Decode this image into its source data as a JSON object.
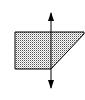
{
  "diagram": {
    "shape": {
      "type": "polygon",
      "fill_pattern": "stipple-dots",
      "stroke_color": "#000000",
      "fill_color": "#9a9a9a",
      "vertices": [
        [
          15,
          32
        ],
        [
          84,
          32
        ],
        [
          84,
          34
        ],
        [
          51,
          69
        ],
        [
          15,
          69
        ]
      ]
    },
    "axis": {
      "type": "double-headed-arrow",
      "orientation": "vertical",
      "x": 51,
      "y_start": 13,
      "y_end": 88,
      "color": "#000000"
    }
  }
}
